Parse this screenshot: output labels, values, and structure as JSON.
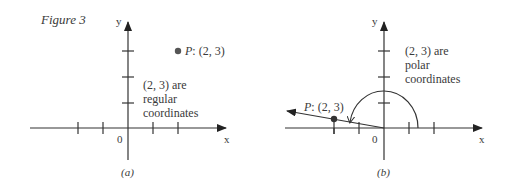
{
  "figure": {
    "title": "Figure 3",
    "panel_a": {
      "caption": "(a)",
      "axis_x": "x",
      "axis_y": "y",
      "origin": "0",
      "point_prefix": "P",
      "point_label": ": (2, 3)",
      "note_lines": [
        "(2, 3) are",
        "regular",
        "coordinates"
      ]
    },
    "panel_b": {
      "caption": "(b)",
      "axis_x": "x",
      "axis_y": "y",
      "origin": "0",
      "point_prefix": "P",
      "point_label": ": (2, 3)",
      "note_lines": [
        "(2, 3) are",
        "polar",
        "coordinates"
      ]
    }
  }
}
